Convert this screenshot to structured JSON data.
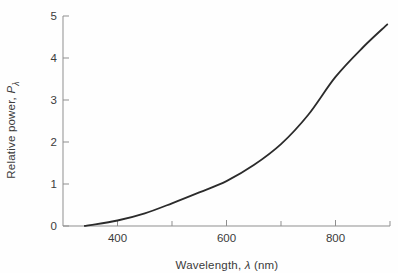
{
  "figure": {
    "background": "#fefefe",
    "axis_color": "#8f8f8f",
    "curve_color": "#2b2b2b",
    "label_color": "#3b3b3b"
  },
  "chart_data": {
    "type": "line",
    "title": "",
    "xlabel": "Wavelength, λ (nm)",
    "xlabel_prefix": "Wavelength, ",
    "xlabel_symbol": "λ",
    "xlabel_suffix": " (nm)",
    "ylabel": "Relative power, Pλ",
    "ylabel_prefix": "Relative power, ",
    "ylabel_symbol": "P",
    "ylabel_subscript": "λ",
    "xlim": [
      300,
      900
    ],
    "ylim": [
      0,
      5
    ],
    "x_major_ticks": [
      400,
      600,
      800
    ],
    "x_minor_ticks": [
      500,
      700,
      900
    ],
    "y_ticks": [
      0,
      1,
      2,
      3,
      4,
      5
    ],
    "grid": false,
    "legend": null,
    "series": [
      {
        "name": "relative-spectral-power",
        "x": [
          340,
          350,
          400,
          450,
          500,
          550,
          600,
          650,
          700,
          750,
          800,
          850,
          895
        ],
        "y": [
          0,
          0.02,
          0.13,
          0.3,
          0.54,
          0.8,
          1.07,
          1.45,
          1.95,
          2.65,
          3.55,
          4.25,
          4.8
        ]
      }
    ]
  }
}
